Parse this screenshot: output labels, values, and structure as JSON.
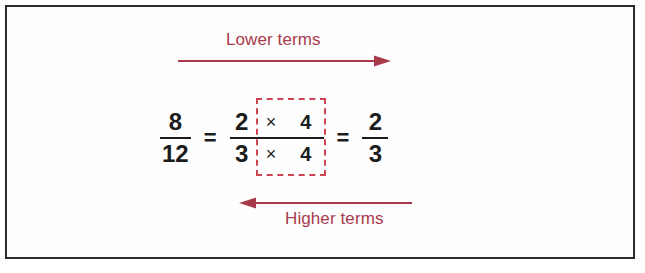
{
  "figure": {
    "background_color": "#ffffff",
    "frame_color": "#2b2b2b",
    "accent_color": "#a83a4c",
    "box_color": "#cf4452",
    "text_color": "#1c1c1c"
  },
  "annotations": {
    "lower": {
      "label": "Lower terms",
      "direction": "right",
      "icon": "arrow-right-icon"
    },
    "higher": {
      "label": "Higher terms",
      "direction": "left",
      "icon": "arrow-left-icon"
    }
  },
  "equation": {
    "left_fraction": {
      "numerator": "8",
      "denominator": "12"
    },
    "equals_1": "=",
    "middle": {
      "numerator": "2",
      "denominator": "3",
      "numerator_factor_operator": "×",
      "numerator_factor": "4",
      "denominator_factor_operator": "×",
      "denominator_factor": "4"
    },
    "equals_2": "=",
    "right_fraction": {
      "numerator": "2",
      "denominator": "3"
    }
  }
}
